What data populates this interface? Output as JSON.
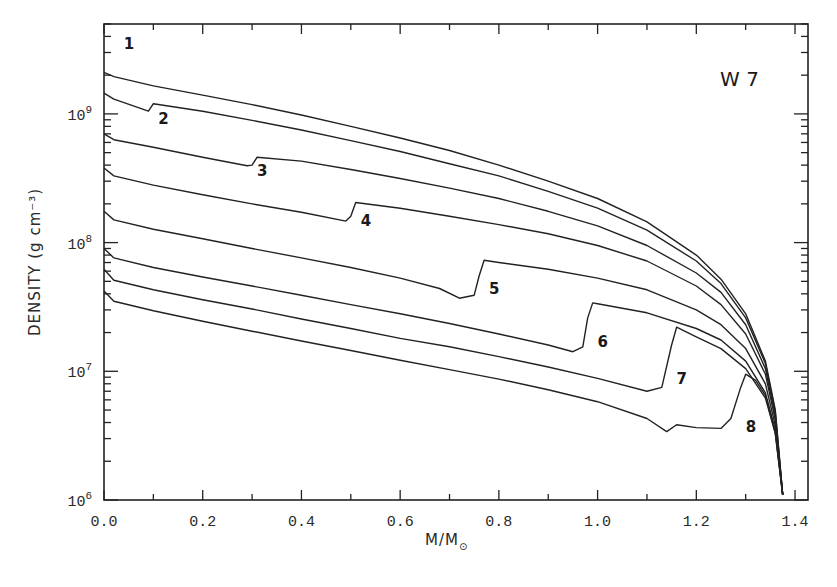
{
  "chart_data": {
    "type": "line",
    "title": "",
    "annotation": "W 7",
    "xlabel": "M/M⊙",
    "xlabel_main": "M/M",
    "xlabel_sub": "⊙",
    "ylabel": "DENSITY (g cm⁻³)",
    "yscale": "log",
    "xlim": [
      0.0,
      1.4
    ],
    "ylim": [
      1000000.0,
      5000000000.0
    ],
    "grid": false,
    "legend": "none (curves labeled inline 1-8)",
    "x_ticks": [
      "0.0",
      "0.2",
      "0.4",
      "0.6",
      "0.8",
      "1.0",
      "1.2",
      "1.4"
    ],
    "y_ticks": [
      {
        "base": "10",
        "exp": "6",
        "value": 1000000.0
      },
      {
        "base": "10",
        "exp": "7",
        "value": 10000000.0
      },
      {
        "base": "10",
        "exp": "8",
        "value": 100000000.0
      },
      {
        "base": "10",
        "exp": "9",
        "value": 1000000000.0
      }
    ],
    "series": [
      {
        "name": "1",
        "label_at": [
          0.04,
          3200000000.0
        ],
        "x": [
          0.0,
          0.02,
          0.1,
          0.2,
          0.3,
          0.4,
          0.5,
          0.6,
          0.7,
          0.8,
          0.9,
          1.0,
          1.1,
          1.2,
          1.25,
          1.3,
          1.34,
          1.36,
          1.375
        ],
        "values": [
          2100000000.0,
          1950000000.0,
          1650000000.0,
          1400000000.0,
          1180000000.0,
          980000000.0,
          800000000.0,
          650000000.0,
          520000000.0,
          400000000.0,
          300000000.0,
          220000000.0,
          145000000.0,
          80000000.0,
          52000000.0,
          28000000.0,
          12000000.0,
          5000000.0,
          1100000.0
        ]
      },
      {
        "name": "2",
        "label_at": [
          0.11,
          830000000.0
        ],
        "x": [
          0.0,
          0.02,
          0.09,
          0.1,
          0.2,
          0.3,
          0.4,
          0.5,
          0.6,
          0.7,
          0.8,
          0.9,
          1.0,
          1.1,
          1.2,
          1.25,
          1.3,
          1.34,
          1.36,
          1.375
        ],
        "values": [
          1450000000.0,
          1300000000.0,
          1050000000.0,
          1200000000.0,
          1050000000.0,
          890000000.0,
          750000000.0,
          620000000.0,
          510000000.0,
          410000000.0,
          330000000.0,
          250000000.0,
          185000000.0,
          125000000.0,
          72000000.0,
          48000000.0,
          26000000.0,
          11500000.0,
          4800000.0,
          1100000.0
        ]
      },
      {
        "name": "3",
        "label_at": [
          0.31,
          330000000.0
        ],
        "x": [
          0.0,
          0.02,
          0.1,
          0.2,
          0.29,
          0.3,
          0.31,
          0.4,
          0.5,
          0.6,
          0.7,
          0.8,
          0.9,
          1.0,
          1.1,
          1.2,
          1.25,
          1.3,
          1.34,
          1.36,
          1.375
        ],
        "values": [
          700000000.0,
          630000000.0,
          550000000.0,
          460000000.0,
          395000000.0,
          400000000.0,
          460000000.0,
          430000000.0,
          370000000.0,
          315000000.0,
          265000000.0,
          220000000.0,
          175000000.0,
          135000000.0,
          95000000.0,
          58000000.0,
          41000000.0,
          23000000.0,
          10500000.0,
          4500000.0,
          1100000.0
        ]
      },
      {
        "name": "4",
        "label_at": [
          0.52,
          135000000.0
        ],
        "x": [
          0.0,
          0.02,
          0.1,
          0.2,
          0.3,
          0.4,
          0.49,
          0.5,
          0.51,
          0.6,
          0.7,
          0.8,
          0.9,
          1.0,
          1.1,
          1.2,
          1.25,
          1.3,
          1.34,
          1.36,
          1.375
        ],
        "values": [
          380000000.0,
          330000000.0,
          280000000.0,
          235000000.0,
          200000000.0,
          172000000.0,
          147000000.0,
          160000000.0,
          205000000.0,
          185000000.0,
          160000000.0,
          138000000.0,
          117000000.0,
          95000000.0,
          72000000.0,
          46000000.0,
          33000000.0,
          19500000.0,
          9500000.0,
          4200000.0,
          1100000.0
        ]
      },
      {
        "name": "5",
        "label_at": [
          0.78,
          40000000.0
        ],
        "x": [
          0.0,
          0.02,
          0.1,
          0.2,
          0.3,
          0.4,
          0.5,
          0.6,
          0.68,
          0.72,
          0.75,
          0.76,
          0.77,
          0.8,
          0.9,
          1.0,
          1.1,
          1.2,
          1.25,
          1.3,
          1.34,
          1.36,
          1.375
        ],
        "values": [
          175000000.0,
          150000000.0,
          127000000.0,
          107000000.0,
          90000000.0,
          76000000.0,
          64000000.0,
          53000000.0,
          44000000.0,
          37000000.0,
          39000000.0,
          55000000.0,
          73000000.0,
          70000000.0,
          62000000.0,
          53000000.0,
          43000000.0,
          30000000.0,
          23000000.0,
          15000000.0,
          8000000.0,
          3800000.0,
          1100000.0
        ]
      },
      {
        "name": "6",
        "label_at": [
          1.0,
          15500000.0
        ],
        "x": [
          0.0,
          0.02,
          0.1,
          0.2,
          0.3,
          0.4,
          0.5,
          0.6,
          0.7,
          0.8,
          0.9,
          0.95,
          0.97,
          0.98,
          0.99,
          1.0,
          1.1,
          1.2,
          1.25,
          1.3,
          1.34,
          1.36,
          1.375
        ],
        "values": [
          90000000.0,
          76000000.0,
          64000000.0,
          54000000.0,
          46000000.0,
          39000000.0,
          33000000.0,
          28000000.0,
          23500000.0,
          19500000.0,
          16000000.0,
          14200000.0,
          15500000.0,
          26000000.0,
          34000000.0,
          33500000.0,
          28500000.0,
          21500000.0,
          17500000.0,
          12000000.0,
          6800000.0,
          3500000.0,
          1100000.0
        ]
      },
      {
        "name": "7",
        "label_at": [
          1.16,
          8000000.0
        ],
        "x": [
          0.0,
          0.02,
          0.1,
          0.2,
          0.3,
          0.4,
          0.5,
          0.6,
          0.7,
          0.8,
          0.9,
          1.0,
          1.1,
          1.13,
          1.15,
          1.16,
          1.2,
          1.25,
          1.3,
          1.34,
          1.36,
          1.375
        ],
        "values": [
          62000000.0,
          51000000.0,
          43000000.0,
          36000000.0,
          30500000.0,
          25500000.0,
          21500000.0,
          18000000.0,
          15500000.0,
          13000000.0,
          10800000.0,
          8800000.0,
          7000000.0,
          7500000.0,
          16000000.0,
          22000000.0,
          18500000.0,
          15000000.0,
          10500000.0,
          6200000.0,
          3300000.0,
          1100000.0
        ]
      },
      {
        "name": "8",
        "label_at": [
          1.3,
          3400000.0
        ],
        "x": [
          0.0,
          0.02,
          0.1,
          0.2,
          0.3,
          0.4,
          0.5,
          0.6,
          0.7,
          0.8,
          0.9,
          1.0,
          1.1,
          1.14,
          1.16,
          1.2,
          1.25,
          1.27,
          1.29,
          1.3,
          1.32,
          1.34,
          1.36,
          1.375
        ],
        "values": [
          42000000.0,
          35000000.0,
          29500000.0,
          24500000.0,
          20500000.0,
          17200000.0,
          14500000.0,
          12200000.0,
          10300000.0,
          8700000.0,
          7200000.0,
          5800000.0,
          4300000.0,
          3400000.0,
          3850000.0,
          3650000.0,
          3600000.0,
          4300000.0,
          7500000.0,
          9500000.0,
          8500000.0,
          6500000.0,
          3300000.0,
          1100000.0
        ]
      }
    ]
  },
  "plot_layout": {
    "left": 104,
    "right": 808,
    "top": 24,
    "bottom": 500,
    "x_zero_px": 104,
    "x_per_unit_px": 493.6,
    "y_decade6_px": 500,
    "px_per_decade": 128.7
  }
}
